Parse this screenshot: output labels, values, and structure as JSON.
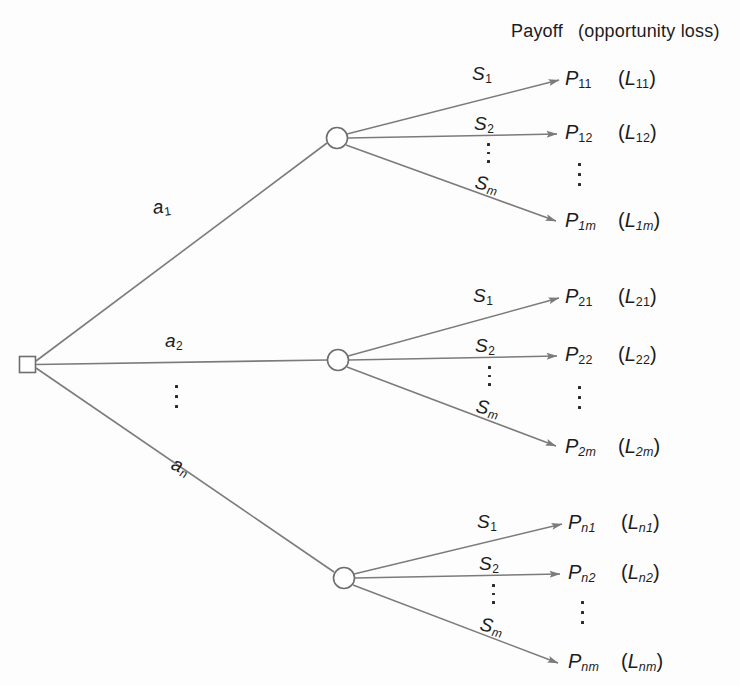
{
  "diagram": {
    "title_payoff": "Payoff",
    "title_loss": "(opportunity loss)",
    "root_node_name": "decision-node",
    "line_color": "#7b7b7b",
    "node_stroke": "#6e6e6e",
    "text_color": "#1c1c1c",
    "background": "#fdfdfd"
  },
  "actions": [
    {
      "base": "a",
      "sub": "1",
      "sub_italic": false
    },
    {
      "base": "a",
      "sub": "2",
      "sub_italic": false
    },
    {
      "base": "a",
      "sub": "n",
      "sub_italic": true
    }
  ],
  "states": [
    {
      "base": "S",
      "sub": "1",
      "sub_italic": false
    },
    {
      "base": "S",
      "sub": "2",
      "sub_italic": false
    },
    {
      "base": "S",
      "sub": "m",
      "sub_italic": true
    }
  ],
  "branches": [
    {
      "action_index": 0,
      "outcomes": [
        {
          "payoff_base": "P",
          "payoff_sub": "11",
          "payoff_sub_italic": false,
          "loss_open": "(",
          "loss_base": "L",
          "loss_sub": "11",
          "loss_sub_italic": false,
          "loss_close": ")"
        },
        {
          "payoff_base": "P",
          "payoff_sub": "12",
          "payoff_sub_italic": false,
          "loss_open": "(",
          "loss_base": "L",
          "loss_sub": "12",
          "loss_sub_italic": false,
          "loss_close": ")"
        },
        {
          "payoff_base": "P",
          "payoff_sub": "1m",
          "payoff_sub_italic": true,
          "loss_open": "(",
          "loss_base": "L",
          "loss_sub": "1m",
          "loss_sub_italic": true,
          "loss_close": ")"
        }
      ]
    },
    {
      "action_index": 1,
      "outcomes": [
        {
          "payoff_base": "P",
          "payoff_sub": "21",
          "payoff_sub_italic": false,
          "loss_open": "(",
          "loss_base": "L",
          "loss_sub": "21",
          "loss_sub_italic": false,
          "loss_close": ")"
        },
        {
          "payoff_base": "P",
          "payoff_sub": "22",
          "payoff_sub_italic": false,
          "loss_open": "(",
          "loss_base": "L",
          "loss_sub": "22",
          "loss_sub_italic": false,
          "loss_close": ")"
        },
        {
          "payoff_base": "P",
          "payoff_sub": "2m",
          "payoff_sub_italic": true,
          "loss_open": "(",
          "loss_base": "L",
          "loss_sub": "2m",
          "loss_sub_italic": true,
          "loss_close": ")"
        }
      ]
    },
    {
      "action_index": 2,
      "outcomes": [
        {
          "payoff_base": "P",
          "payoff_sub": "n1",
          "payoff_sub_italic": true,
          "loss_open": "(",
          "loss_base": "L",
          "loss_sub": "n1",
          "loss_sub_italic": true,
          "loss_close": ")"
        },
        {
          "payoff_base": "P",
          "payoff_sub": "n2",
          "payoff_sub_italic": true,
          "loss_open": "(",
          "loss_base": "L",
          "loss_sub": "n2",
          "loss_sub_italic": true,
          "loss_close": ")"
        },
        {
          "payoff_base": "P",
          "payoff_sub": "nm",
          "payoff_sub_italic": true,
          "loss_open": "(",
          "loss_base": "L",
          "loss_sub": "nm",
          "loss_sub_italic": true,
          "loss_close": ")"
        }
      ]
    }
  ],
  "ellipses": {
    "actions_vertical": "vertical-ellipsis",
    "states_vertical": "vertical-ellipsis",
    "payoffs_vertical": "vertical-ellipsis"
  }
}
